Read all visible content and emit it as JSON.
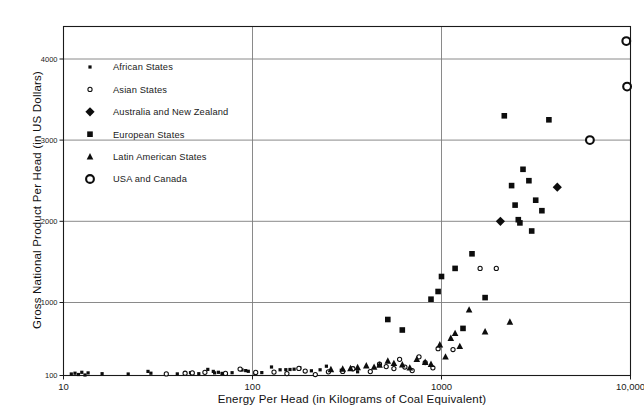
{
  "chart_data": {
    "type": "scatter",
    "title": "",
    "xlabel": "Energy Per Head (in Kilograms of Coal Equivalent)",
    "ylabel": "Gross National Product Per Head (in US Dollars)",
    "xscale": "log",
    "yscale": "linear",
    "xlim": [
      10,
      10000
    ],
    "ylim": [
      100,
      4400
    ],
    "xticks": [
      10,
      100,
      1000,
      10000
    ],
    "xtick_labels": [
      "10",
      "100",
      "1000",
      "10,000"
    ],
    "yticks": [
      100,
      1000,
      2000,
      3000,
      4000
    ],
    "ytick_labels": [
      "100",
      "1000",
      "2000",
      "3000",
      "4000"
    ],
    "grid": "horizontal-and-vertical",
    "legend_position": "upper-left-inside",
    "series": [
      {
        "name": "African States",
        "marker": "small-filled-square",
        "points": [
          [
            11,
            118
          ],
          [
            11.5,
            128
          ],
          [
            12,
            112
          ],
          [
            12.5,
            140
          ],
          [
            13,
            106
          ],
          [
            13.5,
            132
          ],
          [
            16,
            122
          ],
          [
            22,
            118
          ],
          [
            28,
            150
          ],
          [
            29,
            128
          ],
          [
            40,
            120
          ],
          [
            44,
            126
          ],
          [
            47,
            134
          ],
          [
            52,
            122
          ],
          [
            58,
            175
          ],
          [
            62,
            150
          ],
          [
            63,
            132
          ],
          [
            66,
            140
          ],
          [
            69,
            126
          ],
          [
            78,
            135
          ],
          [
            88,
            168
          ],
          [
            92,
            160
          ],
          [
            95,
            152
          ],
          [
            103,
            128
          ],
          [
            112,
            136
          ],
          [
            126,
            205
          ],
          [
            140,
            170
          ],
          [
            150,
            172
          ],
          [
            158,
            174
          ],
          [
            166,
            178
          ],
          [
            178,
            196
          ],
          [
            205,
            158
          ],
          [
            228,
            170
          ],
          [
            246,
            214
          ],
          [
            295,
            165
          ],
          [
            340,
            196
          ],
          [
            360,
            145
          ]
        ]
      },
      {
        "name": "Asian States",
        "marker": "small-open-circle",
        "points": [
          [
            35,
            120
          ],
          [
            44,
            128
          ],
          [
            48,
            132
          ],
          [
            56,
            140
          ],
          [
            72,
            126
          ],
          [
            86,
            180
          ],
          [
            104,
            138
          ],
          [
            130,
            142
          ],
          [
            152,
            124
          ],
          [
            176,
            188
          ],
          [
            190,
            155
          ],
          [
            215,
            112
          ],
          [
            252,
            145
          ],
          [
            300,
            150
          ],
          [
            340,
            182
          ],
          [
            420,
            148
          ],
          [
            470,
            240
          ],
          [
            510,
            210
          ],
          [
            560,
            185
          ],
          [
            600,
            300
          ],
          [
            640,
            205
          ],
          [
            700,
            160
          ],
          [
            760,
            330
          ],
          [
            820,
            260
          ],
          [
            900,
            195
          ],
          [
            960,
            430
          ],
          [
            1150,
            420
          ],
          [
            1600,
            1420
          ],
          [
            1950,
            1420
          ]
        ]
      },
      {
        "name": "Australia and New Zealand",
        "marker": "filled-diamond",
        "points": [
          [
            2050,
            2000
          ],
          [
            4100,
            2420
          ]
        ]
      },
      {
        "name": "European States",
        "marker": "filled-square",
        "points": [
          [
            880,
            1040
          ],
          [
            960,
            1135
          ],
          [
            1000,
            1320
          ],
          [
            1180,
            1420
          ],
          [
            1450,
            1600
          ],
          [
            1700,
            1060
          ],
          [
            2150,
            3300
          ],
          [
            2350,
            2440
          ],
          [
            2450,
            2200
          ],
          [
            2550,
            2020
          ],
          [
            2600,
            1980
          ],
          [
            2700,
            2640
          ],
          [
            2900,
            2500
          ],
          [
            3000,
            1880
          ],
          [
            3150,
            2260
          ],
          [
            3400,
            2130
          ],
          [
            3700,
            3250
          ],
          [
            520,
            790
          ],
          [
            620,
            660
          ],
          [
            1300,
            680
          ]
        ]
      },
      {
        "name": "Latin American States",
        "marker": "filled-triangle",
        "points": [
          [
            260,
            175
          ],
          [
            300,
            182
          ],
          [
            330,
            188
          ],
          [
            360,
            200
          ],
          [
            400,
            222
          ],
          [
            440,
            205
          ],
          [
            470,
            230
          ],
          [
            520,
            280
          ],
          [
            560,
            250
          ],
          [
            620,
            235
          ],
          [
            680,
            195
          ],
          [
            740,
            300
          ],
          [
            820,
            265
          ],
          [
            880,
            240
          ],
          [
            980,
            480
          ],
          [
            1120,
            560
          ],
          [
            1250,
            460
          ],
          [
            1400,
            910
          ],
          [
            1700,
            640
          ],
          [
            2300,
            760
          ],
          [
            1050,
            330
          ],
          [
            1180,
            620
          ]
        ]
      },
      {
        "name": "USA and Canada",
        "marker": "large-open-circle",
        "points": [
          [
            9500,
            4220
          ],
          [
            9600,
            3660
          ],
          [
            6100,
            3000
          ]
        ]
      }
    ]
  },
  "legend": {
    "items": [
      {
        "label": "African States",
        "marker": "small-filled-square"
      },
      {
        "label": "Asian States",
        "marker": "small-open-circle"
      },
      {
        "label": "Australia and New Zealand",
        "marker": "filled-diamond"
      },
      {
        "label": "European States",
        "marker": "filled-square"
      },
      {
        "label": "Latin American States",
        "marker": "filled-triangle"
      },
      {
        "label": "USA and Canada",
        "marker": "large-open-circle"
      }
    ]
  }
}
